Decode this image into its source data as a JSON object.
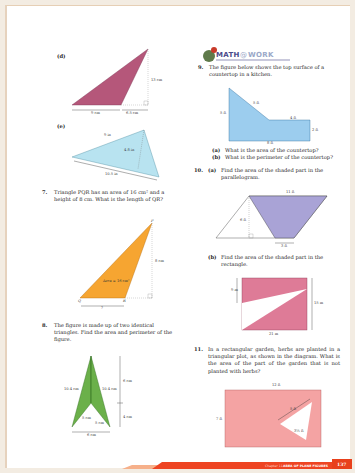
{
  "page": {
    "number": "137",
    "footer_chapter": "Chapter 11",
    "footer_title": "AREA OF PLANE FIGURES"
  },
  "left": {
    "fig_d": {
      "label": "(d)",
      "base": "9 cm",
      "ext": "6.5 cm",
      "height": "13 cm",
      "fill": "#b5577a"
    },
    "fig_e": {
      "label": "(e)",
      "side": "9 in",
      "height": "4.8 in",
      "base": "10.5 in",
      "fill": "#b8e3f0"
    },
    "q7": {
      "number": "7.",
      "text": "Triangle PQR has an area of 16 cm² and a height of 8 cm. What is the length of QR?",
      "fig": {
        "P": "P",
        "Q": "Q",
        "R": "R",
        "area": "Area = 16 cm²",
        "height": "8 cm",
        "base": "?",
        "fill": "#f6a531"
      }
    },
    "q8": {
      "number": "8.",
      "text": "The figure is made up of two identical triangles. Find the area and perimeter of the figure.",
      "fig": {
        "left_side": "10.4 cm",
        "right_side": "10.4 cm",
        "inner_left": "5 cm",
        "inner_right": "5 cm",
        "upper": "6 cm",
        "lower": "4 cm",
        "base": "6 cm",
        "fill": "#6bb04a"
      }
    }
  },
  "right": {
    "banner": {
      "math": "MATH",
      "at": "@",
      "work": "WORK"
    },
    "q9": {
      "number": "9.",
      "text": "The figure below shows the top surface of a countertop in a kitchen.",
      "fig": {
        "left": "5 ft",
        "slant": "5 ft",
        "top": "4 ft",
        "right": "2 ft",
        "bottom": "8 ft",
        "fill": "#9ccdee"
      },
      "a": {
        "label": "(a)",
        "text": "What is the area of the countertop?"
      },
      "b": {
        "label": "(b)",
        "text": "What is the perimeter of the countertop?"
      }
    },
    "q10": {
      "number": "10.",
      "a": {
        "label": "(a)",
        "text": "Find the area of the shaded part in the parallelogram.",
        "fig": {
          "top": "11 ft",
          "height": "6 ft",
          "bottom": "3 ft",
          "fill": "#a9a3d6"
        }
      },
      "b": {
        "label": "(b)",
        "text": "Find the area of the shaded part in the rectangle.",
        "fig": {
          "left": "9 m",
          "right": "15 m",
          "bottom": "21 m",
          "fill": "#de7b97"
        }
      }
    },
    "q11": {
      "number": "11.",
      "text": "In a rectangular garden, herbs are planted in a triangular plot, as shown in the diagram. What is the area of the part of the garden that is not planted with herbs?",
      "fig": {
        "top": "12 ft",
        "left": "7 ft",
        "tri_side": "5 ft",
        "tri_height": "3½ ft",
        "fill": "#f4a3a3"
      }
    }
  }
}
